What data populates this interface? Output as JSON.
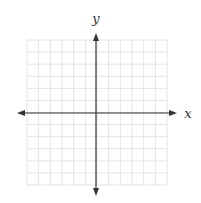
{
  "diagram": {
    "type": "coordinate-plane",
    "x_axis_label": "x",
    "y_axis_label": "y",
    "grid": {
      "columns": 12,
      "rows": 12,
      "left": 27,
      "top": 40,
      "right": 167,
      "bottom": 185,
      "color": "#e4e4e4"
    },
    "axes": {
      "color": "#333333",
      "x_axis": {
        "y": 113,
        "x_start": 17,
        "x_end": 177
      },
      "y_axis": {
        "x": 96,
        "y_start": 33,
        "y_end": 196
      }
    },
    "labels": {
      "y_pos": {
        "x": 96,
        "y": 23
      },
      "x_pos": {
        "x": 188,
        "y": 118
      }
    }
  }
}
